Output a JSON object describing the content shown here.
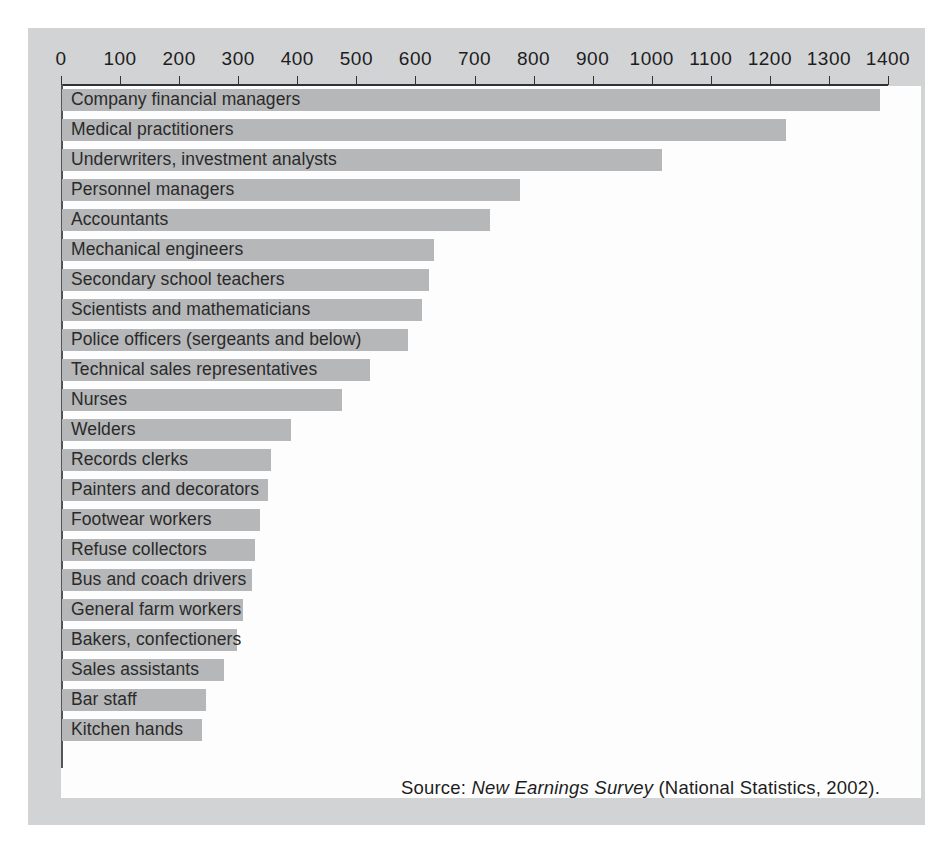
{
  "figure": {
    "source_prefix": "Source:",
    "source_title": "New Earnings Survey",
    "source_suffix": "(National Statistics, 2002)."
  },
  "colors": {
    "bar": "#b6b7b8",
    "panel": "#d2d3d4",
    "plot": "#fdfdfd",
    "axis": "#333333",
    "text": "#2a2a2a"
  },
  "chart_data": {
    "type": "bar",
    "orientation": "horizontal",
    "title": "",
    "xlabel": "",
    "ylabel": "",
    "xlim": [
      0,
      1400
    ],
    "grid": false,
    "legend": null,
    "xticks": [
      0,
      100,
      200,
      300,
      400,
      500,
      600,
      700,
      800,
      900,
      1000,
      1100,
      1200,
      1300,
      1400
    ],
    "xtick_labels": [
      "0",
      "100",
      "200",
      "300",
      "400",
      "500",
      "600",
      "700",
      "800",
      "900",
      "1000",
      "1100",
      "1200",
      "1300",
      "1400"
    ],
    "categories": [
      "Company financial managers",
      "Medical practitioners",
      "Underwriters, investment analysts",
      "Personnel managers",
      "Accountants",
      "Mechanical engineers",
      "Secondary school teachers",
      "Scientists and mathematicians",
      "Police officers (sergeants and below)",
      "Technical sales representatives",
      "Nurses",
      "Welders",
      "Records clerks",
      "Painters and decorators",
      "Footwear workers",
      "Refuse collectors",
      "Bus and coach drivers",
      "General farm workers",
      "Bakers, confectioners",
      "Sales assistants",
      "Bar staff",
      "Kitchen hands"
    ],
    "values": [
      1385,
      1225,
      1015,
      775,
      725,
      630,
      622,
      610,
      585,
      522,
      474,
      388,
      353,
      348,
      336,
      327,
      322,
      306,
      297,
      275,
      244,
      237
    ]
  }
}
